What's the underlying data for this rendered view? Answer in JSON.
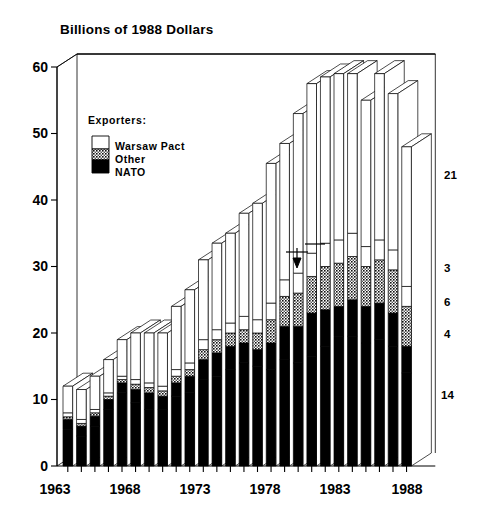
{
  "chart_data": {
    "type": "bar",
    "title": "Billions of 1988 Dollars",
    "xlabel": "",
    "ylabel": "",
    "ylim": [
      0,
      60
    ],
    "yticks": [
      0,
      10,
      20,
      30,
      40,
      50,
      60
    ],
    "xtick_labels": [
      "1963",
      "1968",
      "1973",
      "1978",
      "1983",
      "1988"
    ],
    "xtick_years": [
      1963,
      1968,
      1973,
      1978,
      1983,
      1988
    ],
    "grid": false,
    "stacked": true,
    "legend_position": "inside-upper-left",
    "legend_title": "Exporters:",
    "legend_entries": [
      {
        "label": "Warsaw Pact",
        "color": "#ffffff",
        "pattern": "solid-white"
      },
      {
        "label": "Other",
        "color": "#808080",
        "pattern": "stipple-gray"
      },
      {
        "label": "NATO",
        "color": "#000000",
        "pattern": "solid-black"
      }
    ],
    "categories": [
      "1963",
      "1964",
      "1965",
      "1966",
      "1967",
      "1968",
      "1969",
      "1970",
      "1971",
      "1972",
      "1973",
      "1974",
      "1975",
      "1976",
      "1977",
      "1978",
      "1979",
      "1980",
      "1981",
      "1982",
      "1983",
      "1984",
      "1985",
      "1986",
      "1987",
      "1988"
    ],
    "series": [
      {
        "name": "United States",
        "group": "NATO",
        "color": "#000000",
        "values": [
          5.5,
          4.5,
          6.0,
          8.5,
          11.0,
          9.5,
          8.5,
          8.5,
          10.5,
          11.0,
          13.0,
          13.5,
          14.5,
          15.5,
          15.0,
          14.5,
          16.0,
          15.5,
          16.5,
          18.0,
          19.5,
          19.5,
          18.5,
          19.0,
          18.0,
          14.0
        ]
      },
      {
        "name": "France, UK, etc.",
        "group": "NATO",
        "color": "#000000",
        "values": [
          1.5,
          1.5,
          1.5,
          1.5,
          1.5,
          2.0,
          2.5,
          2.0,
          2.0,
          2.5,
          3.0,
          3.5,
          3.5,
          3.0,
          2.5,
          4.0,
          5.0,
          5.5,
          6.5,
          5.5,
          4.5,
          5.5,
          5.5,
          5.5,
          5.0,
          4.0
        ]
      },
      {
        "name": "Other",
        "group": "Other",
        "color": "#808080",
        "values": [
          0.4,
          0.4,
          0.5,
          0.5,
          0.5,
          0.8,
          0.8,
          0.8,
          1.0,
          1.0,
          1.5,
          2.0,
          2.0,
          2.0,
          2.5,
          3.5,
          4.5,
          5.0,
          5.5,
          6.5,
          6.5,
          6.5,
          6.0,
          6.5,
          6.5,
          6.0
        ]
      },
      {
        "name": "East Europe",
        "group": "Warsaw Pact",
        "color": "#ffffff",
        "values": [
          0.6,
          0.6,
          0.5,
          0.5,
          0.5,
          0.7,
          0.7,
          0.7,
          1.0,
          1.0,
          1.5,
          1.5,
          1.5,
          2.0,
          2.0,
          2.5,
          2.5,
          3.0,
          3.5,
          3.5,
          3.5,
          3.5,
          3.0,
          3.0,
          3.0,
          3.0
        ]
      },
      {
        "name": "Soviet Union",
        "group": "Warsaw Pact",
        "color": "#ffffff",
        "values": [
          4.0,
          4.5,
          5.0,
          5.0,
          5.5,
          7.0,
          7.5,
          8.0,
          9.5,
          11.0,
          12.0,
          13.0,
          13.5,
          15.5,
          17.5,
          21.0,
          20.5,
          24.0,
          25.5,
          25.0,
          25.0,
          24.0,
          22.0,
          25.0,
          23.5,
          21.0
        ]
      }
    ],
    "totals": [
      12.0,
      11.5,
      13.5,
      16.0,
      19.0,
      20.0,
      20.0,
      20.0,
      24.0,
      26.5,
      31.0,
      33.5,
      35.0,
      38.0,
      39.5,
      45.5,
      48.5,
      53.0,
      57.5,
      58.5,
      59.0,
      59.0,
      55.0,
      59.0,
      56.0,
      48.0
    ],
    "annotations": [
      {
        "text": "Soviet Union",
        "series": "Soviet Union"
      },
      {
        "text": "East Europe",
        "series": "East Europe",
        "arrow": "down"
      },
      {
        "text": "Other",
        "series": "Other"
      },
      {
        "text": "France, UK, etc.",
        "series": "France, UK, etc."
      },
      {
        "text": "United States",
        "series": "United States"
      }
    ],
    "final_year_labels": [
      {
        "value": "21",
        "series": "Soviet Union"
      },
      {
        "value": "3",
        "series": "East Europe"
      },
      {
        "value": "6",
        "series": "Other"
      },
      {
        "value": "4",
        "series": "France, UK, etc."
      },
      {
        "value": "14",
        "series": "United States"
      }
    ]
  }
}
